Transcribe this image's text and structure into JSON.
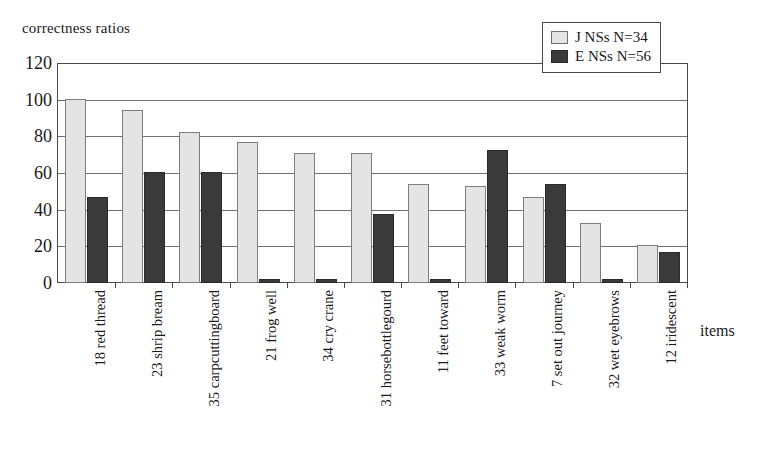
{
  "chart_data": {
    "type": "bar",
    "title": "",
    "ylabel": "correctness ratios",
    "xlabel": "items",
    "ylim": [
      0,
      120
    ],
    "yticks": [
      0,
      20,
      40,
      60,
      80,
      100,
      120
    ],
    "grid": true,
    "legend_position": "top-right",
    "categories": [
      "18 red thread",
      "23 shrip bream",
      "35 carpcuttingboard",
      "21 frog well",
      "34 cry crane",
      "31 horsebottlegourd",
      "11 feet toward",
      "33 weak worm",
      "7 set out journey",
      "32 wet eyebrows",
      "12 iridescent"
    ],
    "series": [
      {
        "name": "J NSs N=34",
        "color": "#e4e4e4",
        "values": [
          101,
          95,
          83,
          77,
          71,
          71,
          54,
          53,
          47,
          33,
          21
        ]
      },
      {
        "name": "E NSs N=56",
        "color": "#3a3a3a",
        "values": [
          47,
          61,
          61,
          2,
          2,
          38,
          2,
          73,
          54,
          2,
          17
        ]
      }
    ]
  },
  "legend": {
    "items": [
      {
        "label": "J NSs N=34",
        "swatch": "light"
      },
      {
        "label": "E NSs N=56",
        "swatch": "dark"
      }
    ]
  },
  "colors": {
    "light_bar": "#e4e4e4",
    "dark_bar": "#3a3a3a",
    "axis": "#4a4a4a",
    "grid": "#6f6f6f",
    "background": "#ffffff"
  }
}
